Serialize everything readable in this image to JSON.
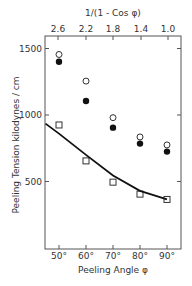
{
  "chart_data": {
    "type": "scatter",
    "title": "",
    "xlabel": "Peeling Angle φ",
    "ylabel": "Peeling Tension",
    "ylabel_units": "kilodynes / cm",
    "top_xlabel": "1/(1 - Cos φ)",
    "x_ticks": [
      "50°",
      "60°",
      "70°",
      "80°",
      "90°"
    ],
    "x_tick_values": [
      50,
      60,
      70,
      80,
      90
    ],
    "top_ticks": [
      "2.6",
      "2.2",
      "1.8",
      "1.4",
      "1.0"
    ],
    "top_tick_values": [
      2.6,
      2.2,
      1.8,
      1.4,
      1.0
    ],
    "y_ticks": [
      "500",
      "1000",
      "1500"
    ],
    "y_tick_values": [
      500,
      1000,
      1500
    ],
    "xlim": [
      45,
      95
    ],
    "ylim": [
      0,
      1600
    ],
    "grid": false,
    "legend": "none",
    "series": [
      {
        "name": "open circles",
        "marker": "open-circle",
        "x": [
          50,
          60,
          70,
          80,
          90
        ],
        "values": [
          1455,
          1255,
          980,
          835,
          775
        ]
      },
      {
        "name": "filled circles",
        "marker": "filled-circle",
        "x": [
          50,
          60,
          70,
          80,
          90
        ],
        "values": [
          1400,
          1105,
          905,
          785,
          725
        ]
      },
      {
        "name": "open squares",
        "marker": "open-square",
        "x": [
          50,
          60,
          70,
          80,
          90
        ],
        "values": [
          925,
          655,
          495,
          405,
          365
        ]
      },
      {
        "name": "theory curve",
        "marker": "line",
        "x": [
          45,
          50,
          60,
          70,
          80,
          90
        ],
        "values": [
          935,
          860,
          700,
          545,
          430,
          366
        ]
      }
    ]
  }
}
